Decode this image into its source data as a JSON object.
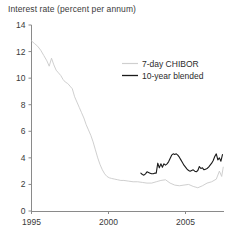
{
  "chart_data": {
    "type": "line",
    "title": "Interest rate (percent per annum)",
    "xlabel": "",
    "ylabel": "",
    "ylim": [
      0,
      14
    ],
    "xlim": [
      1995,
      2007.5
    ],
    "yticks": [
      0,
      2,
      4,
      6,
      8,
      10,
      12,
      14
    ],
    "ytick_labels": [
      "0",
      "2",
      "4",
      "6",
      "8",
      "10",
      "12",
      "14"
    ],
    "xticks": [
      1995,
      2000,
      2005
    ],
    "xtick_labels": [
      "1995",
      "2000",
      "2005"
    ],
    "grid": false,
    "legend_position": "upper right",
    "series": [
      {
        "name": "7-day CHIBOR",
        "color": "#c9c9c9",
        "x": [
          1995.0,
          1995.2,
          1995.4,
          1995.6,
          1995.8,
          1996.0,
          1996.15,
          1996.3,
          1996.45,
          1996.6,
          1996.75,
          1996.9,
          1997.05,
          1997.2,
          1997.35,
          1997.5,
          1997.65,
          1997.8,
          1997.95,
          1998.1,
          1998.25,
          1998.4,
          1998.55,
          1998.7,
          1998.85,
          1999.0,
          1999.15,
          1999.3,
          1999.45,
          1999.6,
          1999.75,
          1999.9,
          2000.05,
          2000.2,
          2000.4,
          2000.6,
          2000.8,
          2001.0,
          2001.3,
          2001.6,
          2001.9,
          2002.2,
          2002.5,
          2002.8,
          2003.1,
          2003.4,
          2003.7,
          2004.0,
          2004.3,
          2004.6,
          2004.9,
          2005.2,
          2005.5,
          2005.8,
          2006.1,
          2006.4,
          2006.7,
          2007.0,
          2007.2,
          2007.35,
          2007.45
        ],
        "y": [
          12.8,
          12.6,
          12.4,
          12.1,
          11.7,
          11.3,
          10.9,
          11.5,
          11.0,
          10.6,
          10.4,
          10.2,
          9.9,
          9.7,
          9.6,
          9.4,
          9.2,
          8.6,
          8.2,
          7.8,
          7.4,
          7.0,
          6.5,
          6.1,
          5.7,
          5.2,
          4.6,
          4.0,
          3.5,
          3.1,
          2.8,
          2.6,
          2.5,
          2.45,
          2.4,
          2.35,
          2.3,
          2.3,
          2.25,
          2.2,
          2.2,
          2.15,
          2.1,
          2.1,
          2.2,
          2.3,
          2.35,
          2.1,
          1.95,
          1.9,
          1.95,
          2.0,
          1.85,
          1.75,
          1.9,
          2.1,
          2.2,
          2.4,
          3.0,
          2.6,
          3.3
        ]
      },
      {
        "name": "10-year blended",
        "color": "#1a1a1a",
        "x": [
          2002.1,
          2002.2,
          2002.3,
          2002.4,
          2002.5,
          2002.6,
          2002.7,
          2002.8,
          2002.9,
          2003.0,
          2003.1,
          2003.2,
          2003.3,
          2003.4,
          2003.5,
          2003.6,
          2003.7,
          2003.8,
          2003.9,
          2004.0,
          2004.1,
          2004.2,
          2004.3,
          2004.4,
          2004.5,
          2004.6,
          2004.7,
          2004.8,
          2004.9,
          2005.0,
          2005.1,
          2005.2,
          2005.3,
          2005.4,
          2005.5,
          2005.6,
          2005.7,
          2005.8,
          2005.9,
          2006.0,
          2006.1,
          2006.2,
          2006.3,
          2006.4,
          2006.5,
          2006.6,
          2006.7,
          2006.8,
          2006.9,
          2007.0,
          2007.1,
          2007.2,
          2007.3,
          2007.4
        ],
        "y": [
          2.85,
          2.75,
          2.7,
          2.8,
          2.95,
          2.9,
          2.85,
          2.8,
          2.8,
          2.85,
          2.85,
          3.6,
          3.25,
          3.55,
          3.3,
          3.55,
          3.45,
          3.55,
          3.7,
          3.95,
          4.2,
          4.3,
          4.25,
          4.3,
          4.2,
          4.05,
          3.85,
          3.65,
          3.45,
          3.3,
          3.15,
          3.05,
          3.0,
          3.05,
          3.1,
          3.0,
          2.95,
          3.05,
          3.35,
          3.2,
          3.25,
          3.1,
          3.15,
          3.2,
          3.3,
          3.45,
          3.6,
          3.8,
          4.1,
          4.3,
          3.85,
          4.0,
          3.75,
          4.25
        ]
      }
    ]
  },
  "legend": {
    "entries": [
      {
        "label": "7-day CHIBOR",
        "swatch": "#cfcfcf"
      },
      {
        "label": "10-year blended",
        "swatch": "#1a1a1a"
      }
    ]
  },
  "axis": {
    "y_labels": [
      "14",
      "12",
      "10",
      "8",
      "6",
      "4",
      "2",
      "0"
    ],
    "x_labels": [
      "1995",
      "2000",
      "2005"
    ]
  }
}
